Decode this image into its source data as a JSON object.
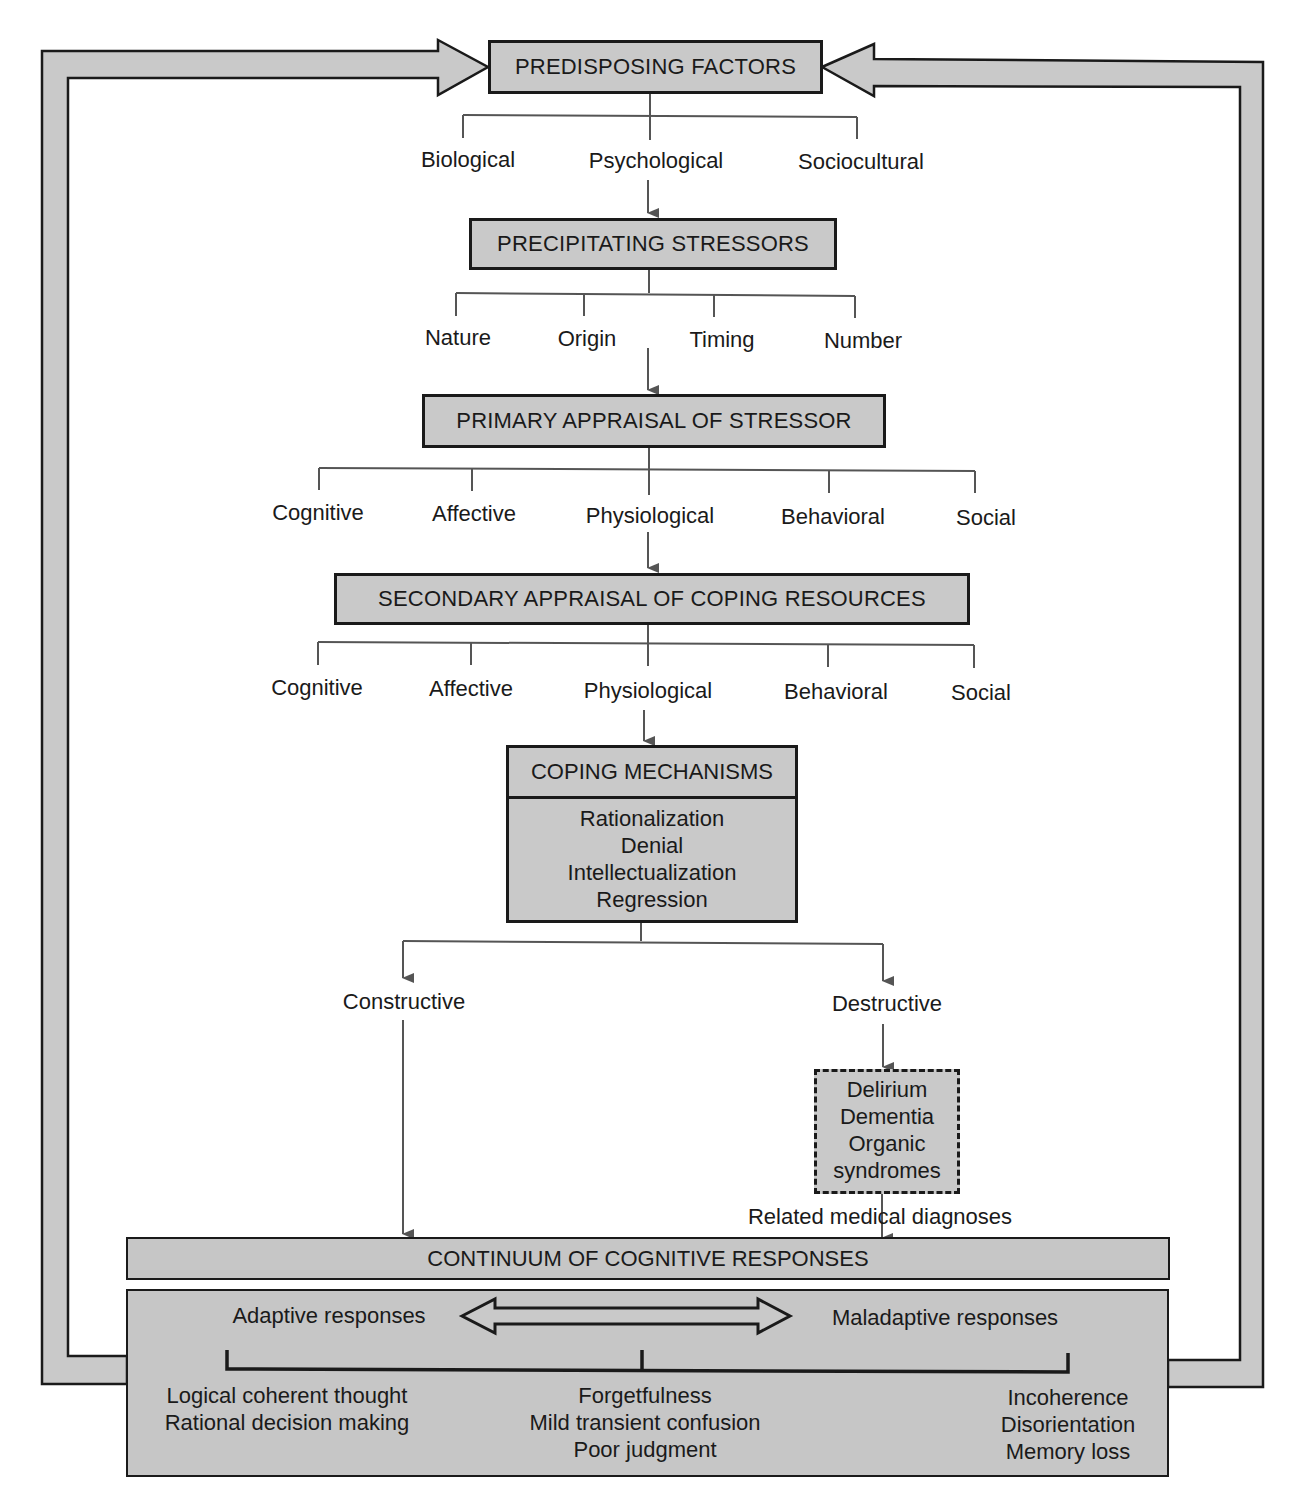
{
  "diagram": {
    "nodes": {
      "predisposing": {
        "title": "PREDISPOSING FACTORS",
        "children": [
          "Biological",
          "Psychological",
          "Sociocultural"
        ]
      },
      "precipitating": {
        "title": "PRECIPITATING STRESSORS",
        "children": [
          "Nature",
          "Origin",
          "Timing",
          "Number"
        ]
      },
      "primary": {
        "title": "PRIMARY APPRAISAL OF STRESSOR",
        "children": [
          "Cognitive",
          "Affective",
          "Physiological",
          "Behavioral",
          "Social"
        ]
      },
      "secondary": {
        "title": "SECONDARY APPRAISAL OF COPING RESOURCES",
        "children": [
          "Cognitive",
          "Affective",
          "Physiological",
          "Behavioral",
          "Social"
        ]
      },
      "coping": {
        "title": "COPING MECHANISMS",
        "items": [
          "Rationalization",
          "Denial",
          "Intellectualization",
          "Regression"
        ]
      },
      "branches": {
        "constructive": "Constructive",
        "destructive": "Destructive"
      },
      "medical": {
        "items": [
          "Delirium",
          "Dementia",
          "Organic",
          "syndromes"
        ],
        "caption": "Related medical diagnoses"
      },
      "continuum": {
        "title": "CONTINUUM OF COGNITIVE RESPONSES",
        "adaptive_label": "Adaptive responses",
        "maladaptive_label": "Maladaptive responses",
        "adaptive_items": [
          "Logical coherent thought",
          "Rational decision making"
        ],
        "middle_items": [
          "Forgetfulness",
          "Mild transient confusion",
          "Poor judgment"
        ],
        "maladaptive_items": [
          "Incoherence",
          "Disorientation",
          "Memory loss"
        ]
      }
    },
    "colors": {
      "box_fill": "#c9c9c9",
      "line": "#555555",
      "border": "#1a1a1a"
    }
  }
}
